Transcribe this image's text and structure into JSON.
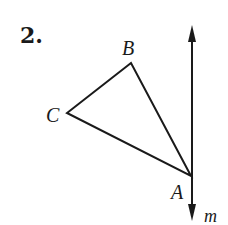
{
  "problem": {
    "number": "2."
  },
  "figure": {
    "triangle": {
      "vertices": [
        {
          "name": "A",
          "label": "A",
          "x": 191,
          "y": 176
        },
        {
          "name": "B",
          "label": "B",
          "x": 131,
          "y": 63
        },
        {
          "name": "C",
          "label": "C",
          "x": 67,
          "y": 113
        }
      ]
    },
    "line": {
      "label": "m",
      "x": 192,
      "y_top": 25,
      "y_bottom": 220,
      "arrows": "both"
    },
    "stroke_color": "#1a1a1a"
  }
}
